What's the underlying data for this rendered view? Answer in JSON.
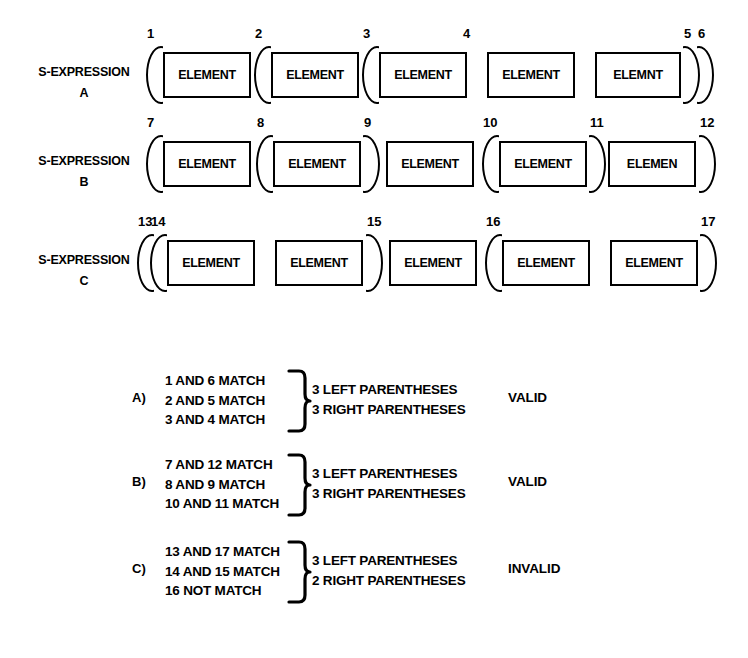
{
  "diagram": {
    "title": "S-Expression parenthesis matching diagram",
    "ink_color": "#000000",
    "background_color": "#ffffff",
    "rows": [
      {
        "label_line1": "S-EXPRESSION",
        "label_line2": "A",
        "tokens": [
          {
            "kind": "paren",
            "dir": "left",
            "num": "1",
            "x": 146
          },
          {
            "kind": "box",
            "text": "ELEMENT",
            "x": 163,
            "w": 88
          },
          {
            "kind": "paren",
            "dir": "left",
            "num": "2",
            "x": 254
          },
          {
            "kind": "box",
            "text": "ELEMENT",
            "x": 271,
            "w": 88
          },
          {
            "kind": "paren",
            "dir": "left",
            "num": "3",
            "x": 362
          },
          {
            "kind": "box",
            "text": "ELEMENT",
            "x": 379,
            "w": 88
          },
          {
            "kind": "numonly",
            "num": "4",
            "x": 463
          },
          {
            "kind": "box",
            "text": "ELEMENT",
            "x": 487,
            "w": 88
          },
          {
            "kind": "box",
            "text": "ELEMNT",
            "x": 595,
            "w": 86
          },
          {
            "kind": "paren",
            "dir": "right",
            "num": "5",
            "x": 683
          },
          {
            "kind": "paren",
            "dir": "right",
            "num": "6",
            "x": 697
          }
        ]
      },
      {
        "label_line1": "S-EXPRESSION",
        "label_line2": "B",
        "tokens": [
          {
            "kind": "paren",
            "dir": "left",
            "num": "7",
            "x": 146
          },
          {
            "kind": "box",
            "text": "ELEMENT",
            "x": 163,
            "w": 88
          },
          {
            "kind": "paren",
            "dir": "left",
            "num": "8",
            "x": 256
          },
          {
            "kind": "box",
            "text": "ELEMENT",
            "x": 273,
            "w": 88
          },
          {
            "kind": "paren",
            "dir": "right",
            "num": "9",
            "x": 363
          },
          {
            "kind": "box",
            "text": "ELEMENT",
            "x": 386,
            "w": 88
          },
          {
            "kind": "paren",
            "dir": "left",
            "num": "10",
            "x": 482
          },
          {
            "kind": "box",
            "text": "ELEMENT",
            "x": 499,
            "w": 88
          },
          {
            "kind": "paren",
            "dir": "right",
            "num": "11",
            "x": 589
          },
          {
            "kind": "box",
            "text": "ELEMEN",
            "x": 608,
            "w": 88
          },
          {
            "kind": "paren",
            "dir": "right",
            "num": "12",
            "x": 699
          }
        ]
      },
      {
        "label_line1": "S-EXPRESSION",
        "label_line2": "C",
        "tokens": [
          {
            "kind": "paren",
            "dir": "left",
            "num": "13",
            "x": 137
          },
          {
            "kind": "paren",
            "dir": "left",
            "num": "14",
            "x": 150
          },
          {
            "kind": "box",
            "text": "ELEMENT",
            "x": 167,
            "w": 88
          },
          {
            "kind": "box",
            "text": "ELEMENT",
            "x": 275,
            "w": 88
          },
          {
            "kind": "paren",
            "dir": "right",
            "num": "15",
            "x": 366
          },
          {
            "kind": "box",
            "text": "ELEMENT",
            "x": 389,
            "w": 88
          },
          {
            "kind": "paren",
            "dir": "left",
            "num": "16",
            "x": 485
          },
          {
            "kind": "box",
            "text": "ELEMENT",
            "x": 502,
            "w": 88
          },
          {
            "kind": "box",
            "text": "ELEMENT",
            "x": 610,
            "w": 88
          },
          {
            "kind": "paren",
            "dir": "right",
            "num": "17",
            "x": 700
          }
        ]
      }
    ],
    "legend": [
      {
        "key": "A)",
        "matches": [
          "1 AND 6 MATCH",
          "2 AND 5 MATCH",
          "3 AND 4 MATCH"
        ],
        "summary": [
          "3 LEFT PARENTHESES",
          "3 RIGHT PARENTHESES"
        ],
        "verdict": "VALID"
      },
      {
        "key": "B)",
        "matches": [
          "7 AND 12 MATCH",
          "8 AND 9 MATCH",
          "10 AND 11 MATCH"
        ],
        "summary": [
          "3 LEFT PARENTHESES",
          "3 RIGHT PARENTHESES"
        ],
        "verdict": "VALID"
      },
      {
        "key": "C)",
        "matches": [
          "13 AND 17 MATCH",
          "14 AND 15 MATCH",
          "16 NOT MATCH"
        ],
        "summary": [
          "3 LEFT PARENTHESES",
          "2 RIGHT PARENTHESES"
        ],
        "verdict": "INVALID"
      }
    ]
  }
}
